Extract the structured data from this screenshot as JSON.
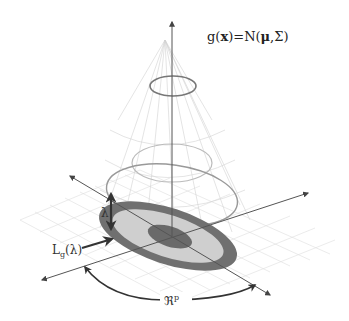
{
  "formula": {
    "lhs": "g(",
    "var": "x",
    "mid": ")=N(",
    "mu": "μ",
    "rest": ",Σ)"
  },
  "labels": {
    "lambda": "λ",
    "level_set_main": "L",
    "level_set_sub": "g",
    "level_set_arg": "(λ)",
    "space_main": "ℜ",
    "space_sup": "p"
  },
  "colors": {
    "axis": "#555555",
    "grid": "#d8d8d8",
    "cone_mesh": "#cfcfcf",
    "contour": "#888888",
    "ring_outer": "#707070",
    "ring_middle": "#cfcfcf",
    "ring_inner": "#6a6a6a",
    "arrow": "#333333"
  }
}
